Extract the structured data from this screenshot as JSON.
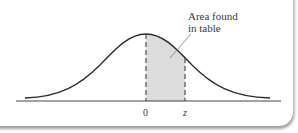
{
  "diagram": {
    "type": "standard-normal-curve",
    "annotation": {
      "line1": "Area found",
      "line2": "in table"
    },
    "axis_labels": {
      "zero": "0",
      "z": "z"
    },
    "colors": {
      "curve": "#2b2b2b",
      "shaded_area": "#dcdcdc",
      "axis": "#444444",
      "dashed_lines": "#333333"
    }
  }
}
